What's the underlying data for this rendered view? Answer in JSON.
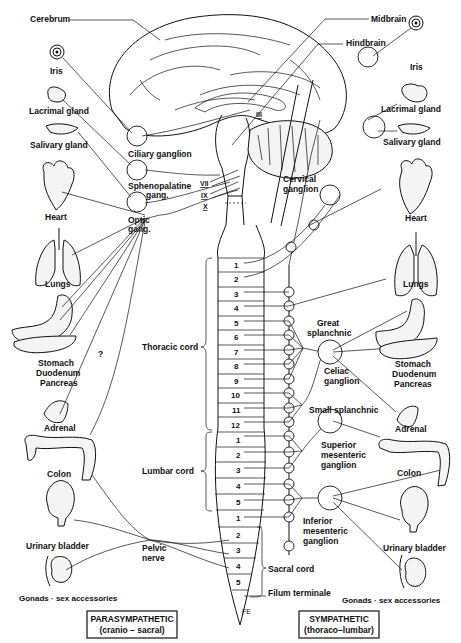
{
  "brain_labels": {
    "cerebrum": "Cerebrum",
    "midbrain": "Midbrain",
    "hindbrain": "Hindbrain"
  },
  "cranial_nerves": [
    "III",
    "VII",
    "IX",
    "X"
  ],
  "parasympathetic": {
    "organs": [
      {
        "name": "Iris"
      },
      {
        "name": "Lacrimal gland"
      },
      {
        "name": "Salivary gland"
      },
      {
        "name": "Heart"
      },
      {
        "name": "Lungs"
      },
      {
        "name": "Stomach"
      },
      {
        "name": "Duodenum"
      },
      {
        "name": "Pancreas"
      },
      {
        "name": "Adrenal"
      },
      {
        "name": "Colon"
      },
      {
        "name": "Urinary bladder"
      },
      {
        "name": "Gonads · sex accessories"
      }
    ],
    "ganglia": [
      {
        "name": "Ciliary ganglion"
      },
      {
        "name": "Sphenopalatine",
        "sub": "gang."
      },
      {
        "name": "Optic",
        "sub": "gang."
      }
    ],
    "pelvic_nerve": [
      "Pelvic",
      "nerve"
    ],
    "uncertain_mark": "?",
    "legend": {
      "line1": "PARASYMPATHETIC",
      "line2": "(cranio – sacral)"
    }
  },
  "sympathetic": {
    "organs": [
      {
        "name": "Iris"
      },
      {
        "name": "Lacrimal gland"
      },
      {
        "name": "Salivary gland"
      },
      {
        "name": "Heart"
      },
      {
        "name": "Lungs"
      },
      {
        "name": "Stomach"
      },
      {
        "name": "Duodenum"
      },
      {
        "name": "Pancreas"
      },
      {
        "name": "Adrenal"
      },
      {
        "name": "Colon"
      },
      {
        "name": "Urinary bladder"
      },
      {
        "name": "Gonads · sex accessories"
      }
    ],
    "ganglia": [
      {
        "lines": [
          "Cervical",
          "ganglion"
        ]
      },
      {
        "lines": [
          "Great",
          "splanchnic"
        ]
      },
      {
        "lines": [
          "Celiac",
          "ganglion"
        ]
      },
      {
        "lines": [
          "Small splanchnic"
        ]
      },
      {
        "lines": [
          "Superior",
          "mesenteric",
          "ganglion"
        ]
      },
      {
        "lines": [
          "Inferior",
          "mesenteric",
          "ganglion"
        ]
      }
    ],
    "legend": {
      "line1": "SYMPATHETIC",
      "line2": "(thoraco–lumbar)"
    }
  },
  "spinal_cord": {
    "thoracic_label": "Thoracic cord",
    "lumbar_label": "Lumbar cord",
    "sacral_label": "Sacral cord",
    "filum_label": "Filum terminale",
    "thoracic_segments": [
      "1",
      "2",
      "3",
      "4",
      "5",
      "6",
      "7",
      "8",
      "9",
      "10",
      "11",
      "12"
    ],
    "lumbar_segments": [
      "1",
      "2",
      "3",
      "4",
      "5"
    ],
    "sacral_segments": [
      "1",
      "2",
      "3",
      "4",
      "5"
    ]
  },
  "signature": "FE"
}
